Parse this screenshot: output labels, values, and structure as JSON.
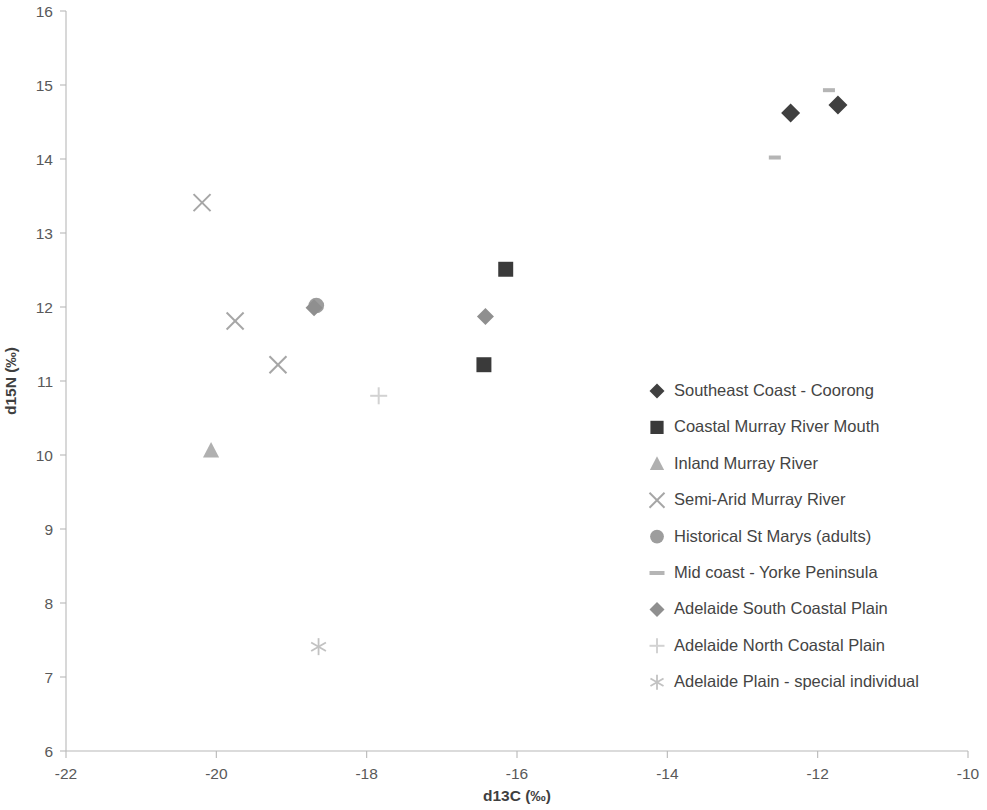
{
  "chart_data": {
    "type": "scatter",
    "title": "",
    "xlabel": "d13C (‰)",
    "ylabel": "d15N (‰)",
    "xlim": [
      -22,
      -10
    ],
    "ylim": [
      6,
      16
    ],
    "xticks": [
      -22,
      -20,
      -18,
      -16,
      -14,
      -12,
      -10
    ],
    "yticks": [
      6,
      7,
      8,
      9,
      10,
      11,
      12,
      13,
      14,
      15,
      16
    ],
    "xtick_labels": [
      "-22",
      "-20",
      "-18",
      "-16",
      "-14",
      "-12",
      "-10"
    ],
    "ytick_labels": [
      "6",
      "7",
      "8",
      "9",
      "10",
      "11",
      "12",
      "13",
      "14",
      "15",
      "16"
    ],
    "grid": false,
    "legend_position": "inside-lower-right",
    "series": [
      {
        "name": "Southeast Coast - Coorong",
        "marker": "diamond",
        "color": "#404040",
        "size": 19,
        "points": [
          {
            "x": -12.36,
            "y": 14.62
          },
          {
            "x": -11.73,
            "y": 14.73
          }
        ]
      },
      {
        "name": "Coastal Murray River Mouth",
        "marker": "square",
        "color": "#3a3a3a",
        "size": 17,
        "points": [
          {
            "x": -16.15,
            "y": 12.51
          },
          {
            "x": -16.44,
            "y": 11.22
          }
        ]
      },
      {
        "name": "Inland Murray River",
        "marker": "triangle",
        "color": "#b0b0b0",
        "size": 17,
        "points": [
          {
            "x": -20.07,
            "y": 10.06
          }
        ]
      },
      {
        "name": "Semi-Arid Murray River",
        "marker": "x",
        "color": "#a6a6a6",
        "size": 17,
        "points": [
          {
            "x": -20.19,
            "y": 13.41
          },
          {
            "x": -19.75,
            "y": 11.81
          },
          {
            "x": -19.18,
            "y": 11.22
          }
        ]
      },
      {
        "name": "Historical St Marys (adults)",
        "marker": "circle",
        "color": "#9d9d9d",
        "size": 17,
        "points": [
          {
            "x": -18.67,
            "y": 12.02
          }
        ]
      },
      {
        "name": "Mid coast - Yorke Peninsula",
        "marker": "dash",
        "color": "#b5b5b5",
        "size": 12,
        "points": [
          {
            "x": -12.57,
            "y": 14.02
          },
          {
            "x": -11.85,
            "y": 14.93
          }
        ]
      },
      {
        "name": "Adelaide South Coastal Plain",
        "marker": "diamond",
        "color": "#8f8f8f",
        "size": 17,
        "points": [
          {
            "x": -16.42,
            "y": 11.87
          },
          {
            "x": -18.7,
            "y": 11.99
          }
        ]
      },
      {
        "name": "Adelaide North Coastal Plain",
        "marker": "plus",
        "color": "#d2d2d2",
        "size": 17,
        "points": [
          {
            "x": -17.84,
            "y": 10.8
          }
        ]
      },
      {
        "name": "Adelaide Plain - special individual",
        "marker": "asterisk",
        "color": "#c2c2c2",
        "size": 17,
        "points": [
          {
            "x": -18.64,
            "y": 7.41
          }
        ]
      }
    ]
  },
  "legend": {
    "entries": [
      {
        "label": "Southeast Coast - Coorong",
        "marker": "diamond",
        "color": "#404040"
      },
      {
        "label": "Coastal Murray River Mouth",
        "marker": "square",
        "color": "#3a3a3a"
      },
      {
        "label": "Inland Murray River",
        "marker": "triangle",
        "color": "#b0b0b0"
      },
      {
        "label": "Semi-Arid Murray River",
        "marker": "x",
        "color": "#a6a6a6"
      },
      {
        "label": "Historical St Marys (adults)",
        "marker": "circle",
        "color": "#9d9d9d"
      },
      {
        "label": "Mid coast - Yorke Peninsula",
        "marker": "dash",
        "color": "#b5b5b5"
      },
      {
        "label": "Adelaide South Coastal Plain",
        "marker": "diamond",
        "color": "#8f8f8f"
      },
      {
        "label": "Adelaide North Coastal Plain",
        "marker": "plus",
        "color": "#d2d2d2"
      },
      {
        "label": "Adelaide Plain - special individual",
        "marker": "asterisk",
        "color": "#c2c2c2"
      }
    ]
  },
  "axes": {
    "x_title": "d13C (‰)",
    "y_title": "d15N (‰)"
  }
}
